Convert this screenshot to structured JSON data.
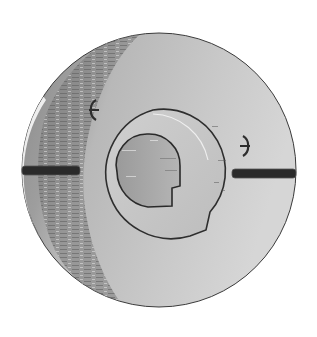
{
  "image": {
    "subject": "grayscale metal disk part with center keyed bore and two side slots",
    "background": "#ffffff",
    "colors": {
      "disk_light": "#d2d2d2",
      "disk_mid": "#b4b4b4",
      "disk_shadow": "#8c8c8c",
      "ring_face": "#c4c4c4",
      "bore": "#a8a8a8",
      "slot": "#2a2a2a",
      "outline": "#3a3a3a"
    },
    "parts": {
      "outer_disk": {
        "cx": 159,
        "cy": 170,
        "r": 137
      },
      "center_ring": {
        "cx": 153,
        "cy": 172,
        "r": 62
      },
      "center_bore": {
        "cx": 148,
        "cy": 165,
        "r": 31
      },
      "left_slot": {
        "x": 22,
        "y": 166,
        "w": 58,
        "h": 9
      },
      "right_slot": {
        "x": 232,
        "y": 169,
        "w": 64,
        "h": 9
      },
      "left_mark": "ϵ",
      "right_mark": "϶"
    }
  }
}
